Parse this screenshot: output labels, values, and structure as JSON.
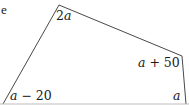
{
  "fragment_text": "e",
  "diagram": {
    "type": "quadrilateral",
    "stroke_color": "#333333",
    "vertices": {
      "top": [
        59,
        5
      ],
      "right_upper": [
        182,
        56
      ],
      "bottom_right": [
        186,
        104
      ],
      "bottom_left": [
        3,
        104
      ]
    },
    "angle_labels": {
      "top": {
        "var": "2",
        "ital": "a",
        "rest": ""
      },
      "right_upper": {
        "var": "",
        "ital": "a",
        "rest": " + 50"
      },
      "bottom_right": {
        "var": "",
        "ital": "a",
        "rest": ""
      },
      "bottom_left": {
        "var": "",
        "ital": "a",
        "rest": " − 20"
      }
    }
  }
}
